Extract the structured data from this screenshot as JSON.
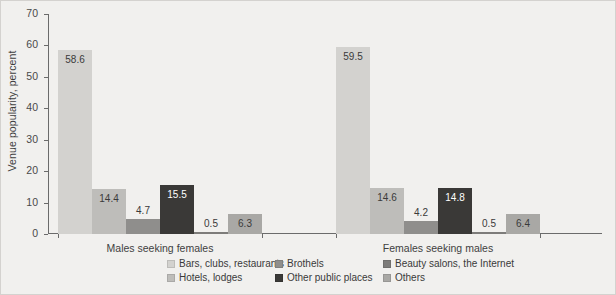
{
  "chart_data": {
    "type": "bar",
    "title": "",
    "xlabel": "",
    "ylabel": "Venue popularity, percent",
    "ylim": [
      0,
      70
    ],
    "yticks": [
      "0",
      "10",
      "20",
      "30",
      "40",
      "50",
      "60",
      "70"
    ],
    "grid": false,
    "legend_position": "bottom",
    "categories": [
      "Males seeking females",
      "Females seeking males"
    ],
    "series": [
      {
        "name": "Bars, clubs, restaurants",
        "color": "#d3d2cf",
        "values": [
          58.6,
          59.5
        ]
      },
      {
        "name": "Hotels, lodges",
        "color": "#bebdba",
        "values": [
          14.4,
          14.6
        ]
      },
      {
        "name": "Brothels",
        "color": "#8f8e8c",
        "values": [
          4.7,
          4.2
        ]
      },
      {
        "name": "Other public places",
        "color": "#3a3937",
        "values": [
          15.5,
          14.8
        ]
      },
      {
        "name": "Beauty salons, the Internet",
        "color": "#7d7c7a",
        "values": [
          0.5,
          0.5
        ]
      },
      {
        "name": "Others",
        "color": "#a9a8a5",
        "values": [
          6.3,
          6.4
        ]
      }
    ],
    "data_labels": {
      "males_seeking_females": [
        "58.6",
        "14.4",
        "4.7",
        "15.5",
        "0.5",
        "6.3"
      ],
      "females_seeking_males": [
        "59.5",
        "14.6",
        "4.2",
        "14.8",
        "0.5",
        "6.4"
      ]
    }
  },
  "legend": {
    "entries": [
      {
        "label": "Bars, clubs, restaurants",
        "color": "#d3d2cf"
      },
      {
        "label": "Brothels",
        "color": "#8f8e8c"
      },
      {
        "label": "Beauty salons, the Internet",
        "color": "#7d7c7a"
      },
      {
        "label": "Hotels, lodges",
        "color": "#bebdba"
      },
      {
        "label": "Other public places",
        "color": "#3a3937"
      },
      {
        "label": "Others",
        "color": "#a9a8a5"
      }
    ]
  }
}
